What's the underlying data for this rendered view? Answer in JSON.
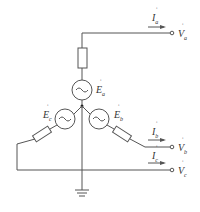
{
  "diagram": {
    "type": "three-phase-wye-source-circuit",
    "stroke_color": "#555555",
    "labels": {
      "Ia": {
        "main": "I",
        "sub": "a",
        "accent": "˙"
      },
      "Va": {
        "main": "V",
        "sub": "a",
        "accent": "˙"
      },
      "Ea": {
        "main": "E",
        "sub": "a",
        "accent": "˙"
      },
      "Eb": {
        "main": "E",
        "sub": "b",
        "accent": "˙"
      },
      "Ec": {
        "main": "E",
        "sub": "c",
        "accent": "˙"
      },
      "Ib": {
        "main": "I",
        "sub": "b",
        "accent": "˙"
      },
      "Vb": {
        "main": "V",
        "sub": "b",
        "accent": "˙"
      },
      "Ic": {
        "main": "I",
        "sub": "c",
        "accent": "˙"
      },
      "Vc": {
        "main": "V",
        "sub": "c",
        "accent": "˙"
      }
    },
    "components": [
      "resistor-a",
      "source-a",
      "source-b",
      "source-c",
      "resistor-b",
      "resistor-c",
      "ground",
      "terminal-a",
      "terminal-b",
      "terminal-c",
      "neutral-junction"
    ]
  }
}
